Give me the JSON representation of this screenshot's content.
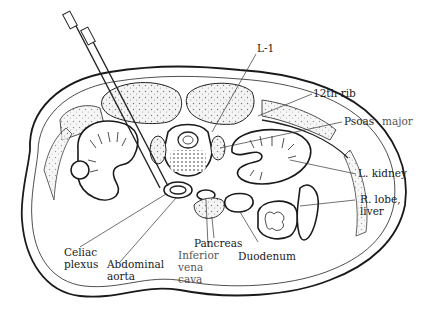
{
  "figure": {
    "labels": {
      "l1": "L-1",
      "rib12": "12th rib",
      "psoas_a": "Psoas",
      "psoas_b": "major",
      "kidney": "L. kidney",
      "liver_a": "R. lobe,",
      "liver_b": "liver",
      "celiac_a": "Celiac",
      "celiac_b": "plexus",
      "aorta_a": "Abdominal",
      "aorta_b": "aorta",
      "pancreas": "Pancreas",
      "ivc_a": "Inferior",
      "ivc_b": "vena",
      "ivc_c": "cava",
      "duodenum": "Duodenum"
    },
    "colors": {
      "ink": "#1a1a1a",
      "light_label": "#555555",
      "background": "#ffffff"
    }
  }
}
